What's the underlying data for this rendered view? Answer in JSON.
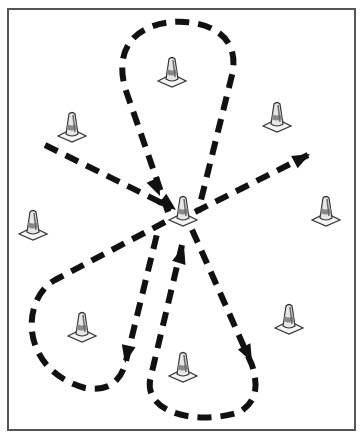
{
  "diagram": {
    "type": "drill-diagram",
    "colors": {
      "border": "#555555",
      "path": "#111111",
      "cone_fill": "#eeeeee",
      "cone_stroke": "#333333",
      "background": "#ffffff"
    },
    "field_border": {
      "x": 8,
      "y": 9,
      "width": 347,
      "height": 421
    },
    "cones": [
      {
        "id": "cone-top-center",
        "x": 172,
        "y": 75
      },
      {
        "id": "cone-upper-left",
        "x": 72,
        "y": 130
      },
      {
        "id": "cone-upper-right",
        "x": 277,
        "y": 120
      },
      {
        "id": "cone-center",
        "x": 183,
        "y": 214
      },
      {
        "id": "cone-mid-left",
        "x": 33,
        "y": 228
      },
      {
        "id": "cone-mid-right",
        "x": 326,
        "y": 214
      },
      {
        "id": "cone-lower-left",
        "x": 82,
        "y": 330
      },
      {
        "id": "cone-lower-right",
        "x": 289,
        "y": 322
      },
      {
        "id": "cone-bottom-center",
        "x": 183,
        "y": 370
      }
    ],
    "paths": [
      {
        "id": "path-top-loop",
        "label": "Top loop around top-center cone, arriving at center",
        "d": "M 168 212 L 125 88 C 110 30, 160 20, 185 22 C 215 24, 240 40, 232 75 L 198 212",
        "arrow_at": [
          155,
          190
        ]
      },
      {
        "id": "path-left-entry",
        "label": "Entry from left to center cone",
        "d": "M 45 145 L 172 208",
        "arrow_at": [
          172,
          208
        ]
      },
      {
        "id": "path-right-exit",
        "label": "Exit from center toward upper right",
        "d": "M 195 212 L 308 155",
        "arrow_at": [
          308,
          155
        ]
      },
      {
        "id": "path-lower-left-loop",
        "label": "Loop around lower-left cone, down from center",
        "d": "M 165 222 L 55 280 C 20 300, 20 370, 85 388 C 110 392, 120 380, 125 365 L 158 230",
        "arrow_at": [
          125,
          365
        ]
      },
      {
        "id": "path-lower-right-loop",
        "label": "Loop around bottom-center cone, up to center then down right",
        "d": "M 182 245 L 150 380 C 145 415, 200 425, 240 412 C 258 400, 258 385, 252 365 L 190 225",
        "arrow_at": [
          252,
          365
        ]
      }
    ]
  }
}
